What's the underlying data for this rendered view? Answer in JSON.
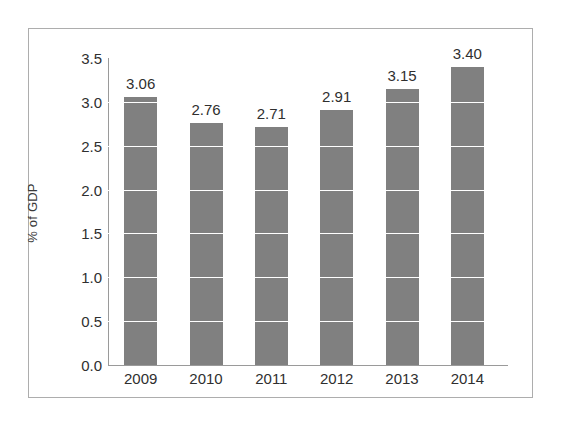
{
  "chart_data": {
    "type": "bar",
    "title": "",
    "subtitle": "",
    "xlabel": "",
    "ylabel": "% of GDP",
    "categories": [
      "2009",
      "2010",
      "2011",
      "2012",
      "2013",
      "2014"
    ],
    "values": [
      3.06,
      2.76,
      2.71,
      2.91,
      3.15,
      3.4
    ],
    "data_labels": [
      "3.06",
      "2.76",
      "2.71",
      "2.91",
      "3.15",
      "3.40"
    ],
    "ylim": [
      0.0,
      3.5
    ],
    "ytick_labels": [
      "0.0",
      "0.5",
      "1.0",
      "1.5",
      "2.0",
      "2.5",
      "3.0",
      "3.5"
    ],
    "ytick_values": [
      0.0,
      0.5,
      1.0,
      1.5,
      2.0,
      2.5,
      3.0,
      3.5
    ],
    "grid": "horizontal-white-gridlines",
    "legend": "none",
    "series": [
      {
        "name": "% of GDP",
        "values": [
          3.06,
          2.76,
          2.71,
          2.91,
          3.15,
          3.4
        ]
      }
    ],
    "colors": {
      "bar_fill": "#808080",
      "gridline": "#ffffff",
      "axis_line": "#9a9a9a",
      "text": "#2f2f2f",
      "frame_border": "#adadad",
      "background": "#ffffff"
    }
  }
}
